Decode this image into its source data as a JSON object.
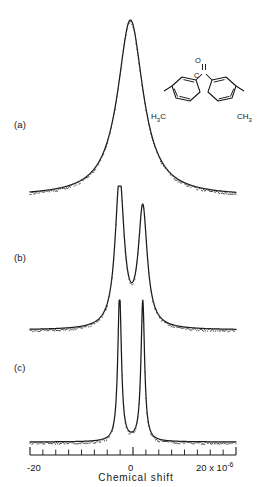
{
  "figure": {
    "type": "nmr-spectra-stack",
    "panels": [
      {
        "id": "a",
        "label": "(a)"
      },
      {
        "id": "b",
        "label": "(b)"
      },
      {
        "id": "c",
        "label": "(c)"
      }
    ],
    "axis": {
      "title": "Chemical shift",
      "tick_labels": {
        "left": "-20",
        "center": "0",
        "right": "20 x 10",
        "right_exponent": "-6"
      },
      "min": -20,
      "max": 20,
      "tick_step": 2.5,
      "major_ticks": [
        -20,
        0,
        20
      ]
    },
    "structure": {
      "name": "4,4'-dimethylbenzophenone",
      "carbonyl_carbon": "C",
      "carbonyl_oxygen": "O",
      "methyl_left": "H<sub>3</sub>C",
      "methyl_left_text": "H3C",
      "methyl_right_text": "CH3",
      "ring_count": 2
    },
    "colors": {
      "curve": "#1a1a1a",
      "points": "#444444",
      "axis": "#161616",
      "background": "#ffffff"
    }
  },
  "chart_data": {
    "type": "line",
    "title": "",
    "xlabel": "Chemical shift",
    "ylabel": "",
    "xlim": [
      -20,
      20
    ],
    "grid": false,
    "legend": false,
    "units": "x 10^-6",
    "series": [
      {
        "name": "(a)",
        "panel": "a",
        "description": "single broad unresolved line centred near 0",
        "peaks": [
          {
            "center": -0.5,
            "height": 1.0,
            "width": 6.0
          }
        ],
        "baseline": 0.0,
        "overlay": "experimental points"
      },
      {
        "name": "(b)",
        "panel": "b",
        "description": "partially resolved doublet, left component taller",
        "peaks": [
          {
            "center": -2.6,
            "height": 1.0,
            "width": 2.1
          },
          {
            "center": 1.9,
            "height": 0.8,
            "width": 2.1
          }
        ],
        "baseline": 0.0,
        "overlay": "experimental points"
      },
      {
        "name": "(c)",
        "panel": "c",
        "description": "fully resolved narrow doublet, peaks clipped at panel top",
        "peaks": [
          {
            "center": -2.6,
            "height": 1.0,
            "width": 0.85
          },
          {
            "center": 1.9,
            "height": 0.95,
            "width": 0.85
          }
        ],
        "baseline": 0.0,
        "overlay": "experimental points"
      }
    ]
  }
}
